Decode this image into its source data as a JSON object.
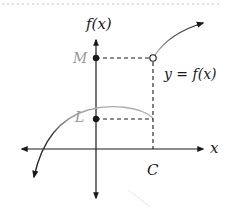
{
  "diagram": {
    "type": "function-graph-jump-discontinuity",
    "labels": {
      "y_axis": "f(x)",
      "x_axis": "x",
      "upper_value": "M",
      "lower_value": "L",
      "x_point": "C",
      "function": "y = f(x)"
    },
    "points": {
      "M": {
        "kind": "filled-dot",
        "on": "y-axis"
      },
      "L": {
        "kind": "filled-dot",
        "on": "y-axis"
      },
      "open_circle": {
        "kind": "open-dot",
        "at": "(C, M)"
      }
    },
    "colors": {
      "axis": "#1a1a1a",
      "dashed": "#1a1a1a",
      "curve_dark": "#1a1a1a",
      "curve_light": "#b0b0b0",
      "value_label": "#9a9a9a",
      "top_dotted_border": "#d8d8d8"
    }
  }
}
